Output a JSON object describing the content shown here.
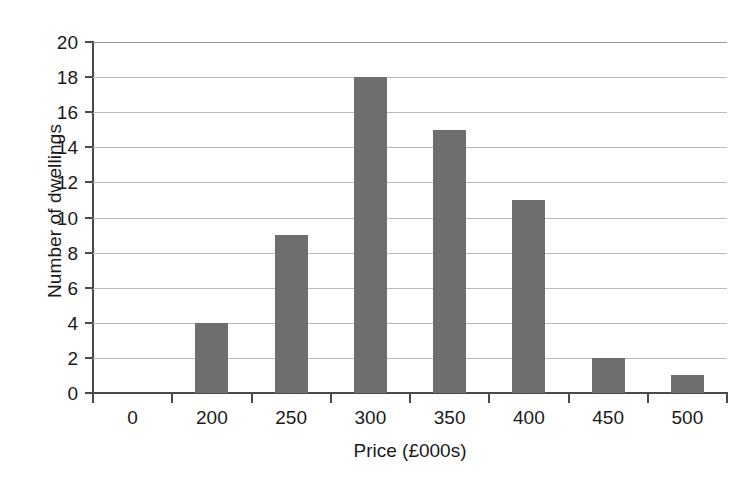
{
  "chart_data": {
    "type": "bar",
    "title": "",
    "subtitle": "",
    "xlabel": "Price (£000s)",
    "ylabel": "Number of dwellings",
    "categories": [
      "0",
      "200",
      "250",
      "300",
      "350",
      "400",
      "450",
      "500"
    ],
    "values": [
      0,
      4,
      9,
      18,
      15,
      11,
      2,
      1
    ],
    "xtick_labels": [
      "0",
      "200",
      "250",
      "300",
      "350",
      "400",
      "450",
      "500"
    ],
    "ytick_labels": [
      "0",
      "2",
      "4",
      "6",
      "8",
      "10",
      "12",
      "14",
      "16",
      "18",
      "20"
    ],
    "ytick_values": [
      0,
      2,
      4,
      6,
      8,
      10,
      12,
      14,
      16,
      18,
      20
    ],
    "ylim": [
      0,
      20
    ],
    "grid": "horizontal",
    "legend": "none",
    "bar_color": "#6e6e6e",
    "grid_color": "#b9b9b9",
    "axis_color": "#4a4a4a",
    "background_color": "#ffffff",
    "annotations": []
  }
}
